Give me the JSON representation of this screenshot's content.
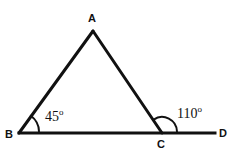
{
  "figure": {
    "kind": "geometry-diagram",
    "background_color": "#ffffff",
    "stroke_color": "#111111",
    "stroke_width": 3,
    "width": 235,
    "height": 154
  },
  "vertices": [
    {
      "id": "A",
      "label": "A",
      "x": 93,
      "y": 31
    },
    {
      "id": "B",
      "label": "B",
      "x": 19,
      "y": 133
    },
    {
      "id": "C",
      "label": "C",
      "x": 162,
      "y": 133
    },
    {
      "id": "D",
      "label": "D",
      "x": 215,
      "y": 133
    }
  ],
  "segments": [
    {
      "id": "AB",
      "from": "B",
      "to": "A"
    },
    {
      "id": "AC",
      "from": "A",
      "to": "C"
    },
    {
      "id": "BD",
      "from": "B",
      "to": "D"
    }
  ],
  "angles": [
    {
      "id": "angle-B",
      "at": "B",
      "value": "45",
      "unit": "o",
      "text": "45o",
      "arc_radius": 20,
      "arc_start_deg": 0,
      "arc_end_deg": 54
    },
    {
      "id": "angle-C",
      "at": "C",
      "value": "110",
      "unit": "o",
      "text": "110o",
      "arc_radius": 15,
      "arc_start_deg": 0,
      "arc_end_deg": 124
    }
  ],
  "labels": {
    "A": "A",
    "B": "B",
    "C": "C",
    "D": "D",
    "angle_B_value": "45",
    "angle_B_degree_symbol": "o",
    "angle_C_value": "110",
    "angle_C_degree_symbol": "o"
  }
}
